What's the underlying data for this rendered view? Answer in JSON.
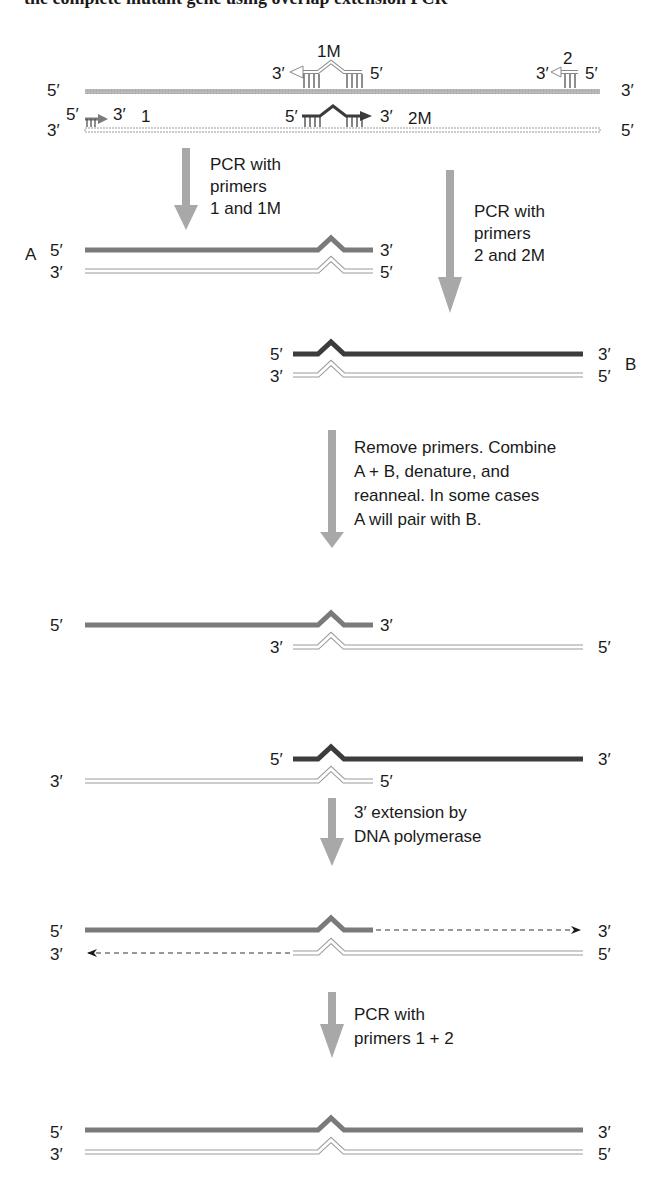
{
  "header": {
    "text_cropped": "the complete mutant gene using overlap extension PCR"
  },
  "colors": {
    "template_top": "#b5b5b5",
    "product_A": "#7a7a7a",
    "product_B": "#3c3c3c",
    "open_strand_stroke": "#8a8a8a",
    "arrow": "#a8a8a8",
    "text": "#1a1a1a"
  },
  "template": {
    "top_left": "5′",
    "top_right": "3′",
    "bottom_left": "3′",
    "bottom_right": "5′",
    "primers": {
      "p1": {
        "name": "1",
        "left": "5′",
        "right": "3′"
      },
      "p1M": {
        "name": "1M",
        "left": "3′",
        "right": "5′"
      },
      "p2M": {
        "name": "2M",
        "left": "5′",
        "right": "3′"
      },
      "p2": {
        "name": "2",
        "left": "3′",
        "right": "5′"
      }
    }
  },
  "steps": [
    {
      "id": "pcr-1-1m",
      "lines": [
        "PCR with",
        "primers",
        "1 and 1M"
      ]
    },
    {
      "id": "pcr-2-2m",
      "lines": [
        "PCR with",
        "primers",
        "2 and 2M"
      ]
    },
    {
      "id": "combine",
      "lines": [
        "Remove primers. Combine",
        "A + B, denature, and",
        "reanneal. In some cases",
        "A will pair with B."
      ]
    },
    {
      "id": "extension",
      "lines": [
        "3′ extension by",
        "DNA polymerase"
      ]
    },
    {
      "id": "pcr-1-2",
      "lines": [
        "PCR with",
        "primers 1 + 2"
      ]
    }
  ],
  "products": {
    "A": {
      "label": "A",
      "top_left": "5′",
      "top_right": "3′",
      "bottom_left": "3′",
      "bottom_right": "5′"
    },
    "B": {
      "label": "B",
      "top_left": "5′",
      "top_right": "3′",
      "bottom_left": "3′",
      "bottom_right": "5′"
    }
  },
  "hybrid1": {
    "top_left": "5′",
    "top_right": "3′",
    "bottom_left": "3′",
    "bottom_right": "5′"
  },
  "hybrid2": {
    "top_left": "5′",
    "top_right": "3′",
    "bottom_left": "3′",
    "bottom_right": "5′"
  },
  "extended": {
    "top_left": "5′",
    "top_right": "3′",
    "bottom_left": "3′",
    "bottom_right": "5′"
  },
  "final": {
    "top_left": "5′",
    "top_right": "3′",
    "bottom_left": "3′",
    "bottom_right": "5′"
  }
}
